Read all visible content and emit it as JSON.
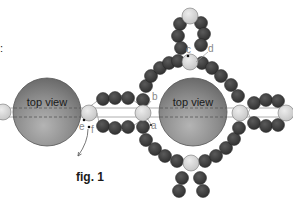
{
  "figure": {
    "caption": "fig. 1",
    "left_sphere_label": "top view",
    "right_sphere_label": "top view",
    "edge_mark": ":",
    "labels": {
      "a": "a",
      "b": "b",
      "c": "c",
      "d": "d",
      "e": "e",
      "f": "f"
    }
  },
  "colors": {
    "background": "#ffffff",
    "sphere": "#8a8a8a",
    "seed_bead": "#3e3e3e",
    "pearl": "#d6d6d6",
    "thread": "#9a9a9a",
    "label": "#888888",
    "text": "#1a1a1a"
  },
  "beads": {
    "big_spheres": [
      {
        "name": "left-sphere",
        "cx": 47,
        "cy": 112,
        "r": 34
      },
      {
        "name": "right-sphere",
        "cx": 193,
        "cy": 112,
        "r": 34
      }
    ],
    "pearls": [
      {
        "name": "pearl-far-left",
        "cx": 3,
        "cy": 112,
        "r": 8
      },
      {
        "name": "pearl-ef",
        "cx": 89,
        "cy": 113,
        "r": 8
      },
      {
        "name": "pearl-ab",
        "cx": 143,
        "cy": 113,
        "r": 8
      },
      {
        "name": "pearl-right",
        "cx": 240,
        "cy": 113,
        "r": 8
      },
      {
        "name": "pearl-far-right",
        "cx": 286,
        "cy": 113,
        "r": 8
      },
      {
        "name": "pearl-cd",
        "cx": 190,
        "cy": 62,
        "r": 8
      },
      {
        "name": "pearl-top",
        "cx": 190,
        "cy": 16,
        "r": 8
      },
      {
        "name": "pearl-bottom",
        "cx": 191,
        "cy": 163,
        "r": 8
      }
    ]
  }
}
